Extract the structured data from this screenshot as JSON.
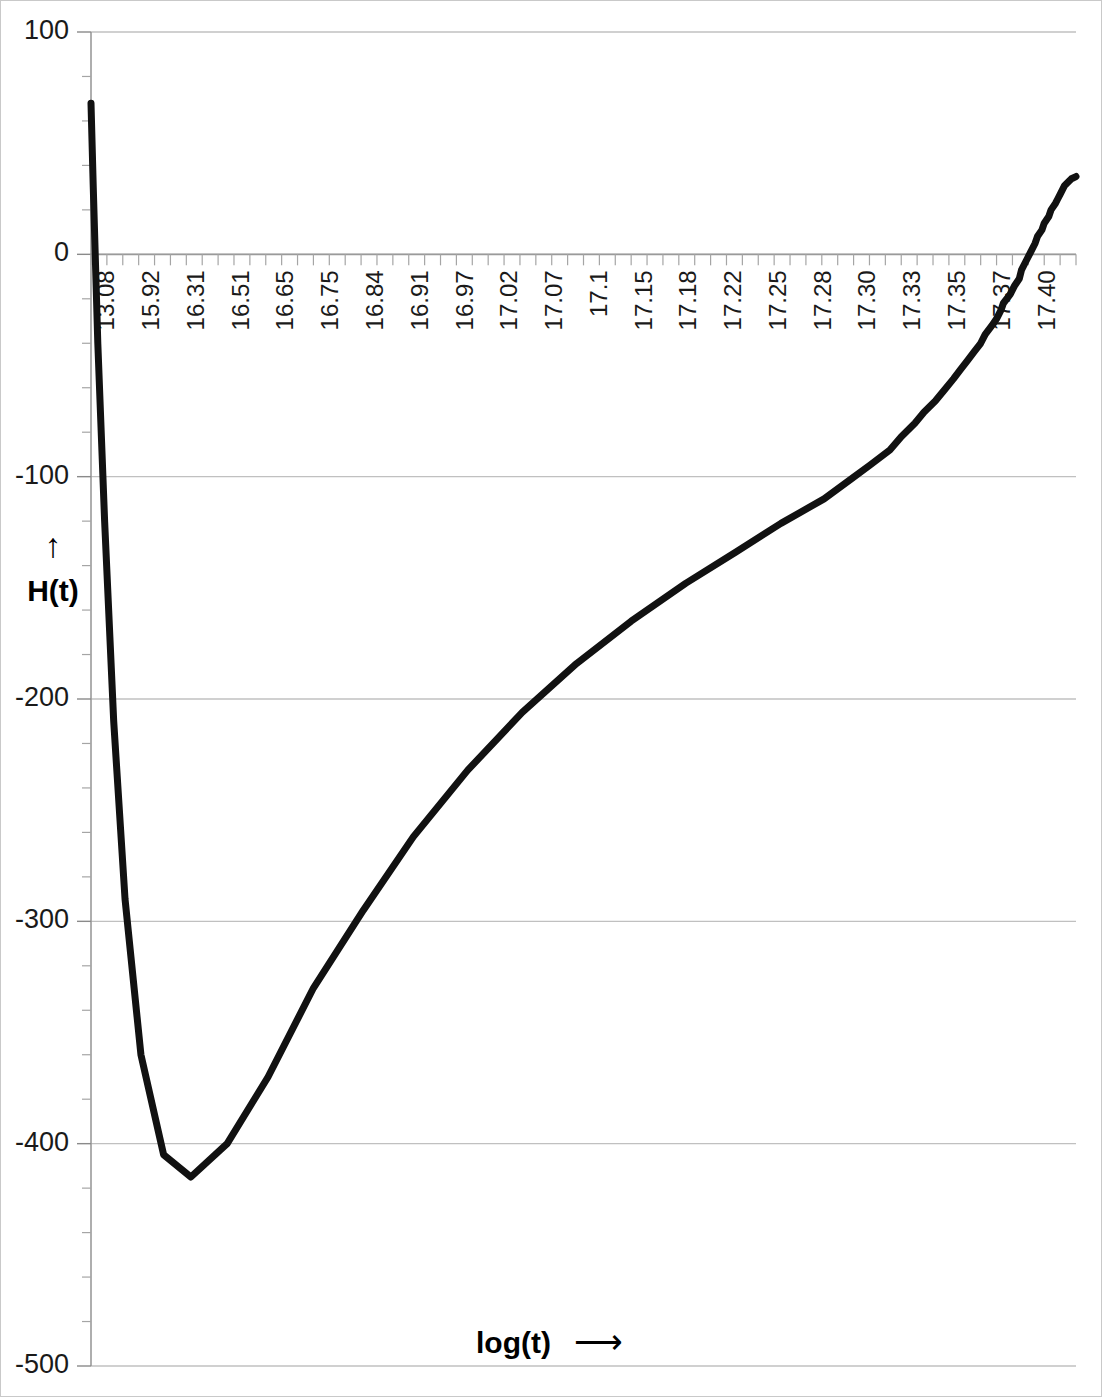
{
  "chart_data": {
    "type": "line",
    "title": "",
    "subtitle": "",
    "xlabel": "log(t)",
    "xlabel_arrow": "⟶",
    "ylabel": "H(t)",
    "ylabel_arrow": "↑",
    "grid": true,
    "legend": "none",
    "xlim": [
      13.08,
      17.42
    ],
    "ylim": [
      -500,
      100
    ],
    "y_ticks": [
      100,
      0,
      -100,
      -200,
      -300,
      -400,
      -500
    ],
    "y_tick_labels": [
      "100",
      "0",
      "-100",
      "-200",
      "-300",
      "-400",
      "-500"
    ],
    "y_minor_tick_count_between": 4,
    "x_tick_labels": [
      "13.08",
      "15.92",
      "16.31",
      "16.51",
      "16.65",
      "16.75",
      "16.84",
      "16.91",
      "16.97",
      "17.02",
      "17.07",
      "17.1",
      "17.15",
      "17.18",
      "17.22",
      "17.25",
      "17.28",
      "17.30",
      "17.33",
      "17.35",
      "17.37",
      "17.40"
    ],
    "x_minor_tick_count": 62,
    "series": [
      {
        "name": "H(t)",
        "color": "#111111",
        "x": [
          13.08,
          13.09,
          13.11,
          13.14,
          13.18,
          13.23,
          13.3,
          13.4,
          13.52,
          13.68,
          13.86,
          14.06,
          14.28,
          14.5,
          14.74,
          14.98,
          15.22,
          15.46,
          15.7,
          15.92,
          16.12,
          16.31,
          16.43,
          16.51,
          16.6,
          16.65,
          16.71,
          16.75,
          16.8,
          16.84,
          16.88,
          16.91,
          16.94,
          16.97,
          17.0,
          17.02,
          17.05,
          17.07,
          17.09,
          17.1,
          17.13,
          17.15,
          17.17,
          17.18,
          17.2,
          17.22,
          17.24,
          17.25,
          17.27,
          17.28,
          17.3,
          17.31,
          17.33,
          17.34,
          17.35,
          17.36,
          17.37,
          17.39,
          17.4,
          17.42
        ],
        "y": [
          68,
          30,
          -40,
          -120,
          -210,
          -290,
          -360,
          -405,
          -415,
          -400,
          -370,
          -330,
          -295,
          -262,
          -232,
          -206,
          -184,
          -165,
          -148,
          -134,
          -121,
          -110,
          -101,
          -95,
          -88,
          -82,
          -76,
          -71,
          -66,
          -61,
          -56,
          -52,
          -48,
          -44,
          -40,
          -36,
          -32,
          -29,
          -25,
          -22,
          -18,
          -14,
          -11,
          -7,
          -3,
          1,
          5,
          8,
          11,
          14,
          17,
          20,
          23,
          25,
          27,
          29,
          31,
          33,
          34,
          35
        ]
      }
    ],
    "annotations": []
  },
  "axes": {
    "y_axis_title": "H(t)",
    "y_axis_arrow": "↑",
    "x_axis_title": "log(t)",
    "x_axis_arrow": "⟶"
  },
  "colors": {
    "curve": "#111111",
    "grid": "#c0c0c0",
    "axis": "#9a9a9a",
    "text": "#1a1a1a",
    "background": "#ffffff",
    "border": "#c9c9c9"
  }
}
